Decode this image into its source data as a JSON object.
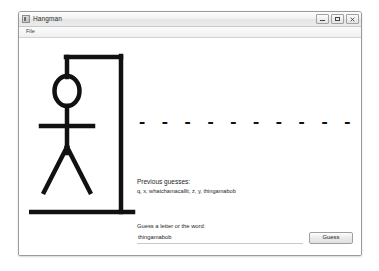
{
  "window": {
    "title": "Hangman",
    "icon": "app-icon",
    "controls": {
      "minimize_label": "–",
      "maximize_label": "□",
      "close_label": "✕"
    }
  },
  "menubar": {
    "items": [
      {
        "label": "File"
      }
    ]
  },
  "game": {
    "word_display": "- - - - - - - - - - -",
    "word_length": 11,
    "gallows_state": "full-figure",
    "figure_parts": [
      "head",
      "body",
      "arms",
      "legs"
    ]
  },
  "guesses": {
    "heading": "Previous guesses:",
    "list_text": "q, x, whatchamacallit, z, y, thingamabob",
    "items": [
      "q",
      "x",
      "whatchamacallit",
      "z",
      "y",
      "thingamabob"
    ]
  },
  "input": {
    "label": "Guess a letter or the word:",
    "value": "thingamabob",
    "placeholder": "",
    "button_label": "Guess"
  },
  "colors": {
    "ink": "#111111",
    "window_border": "#9a9a9a",
    "page_background": "#ffffff"
  }
}
